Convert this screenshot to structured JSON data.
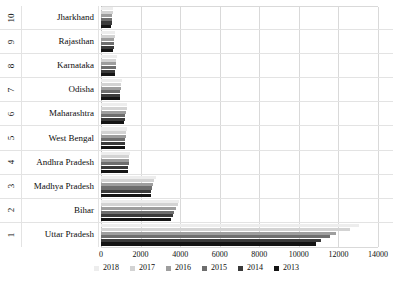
{
  "chart_data": {
    "type": "bar",
    "orientation": "horizontal",
    "title": "",
    "xlabel": "",
    "ylabel": "",
    "xlim": [
      0,
      14000
    ],
    "xticks": [
      "0",
      "2000",
      "4000",
      "6000",
      "8000",
      "10000",
      "12000",
      "14000"
    ],
    "grid": true,
    "legend_position": "bottom",
    "ranks": [
      "10",
      "9",
      "8",
      "7",
      "6",
      "5",
      "4",
      "3",
      "2",
      "1"
    ],
    "categories": [
      "Jharkhand",
      "Rajasthan",
      "Karnataka",
      "Odisha",
      "Maharashtra",
      "West Bengal",
      "Andhra Pradesh",
      "Madhya Pradesh",
      "Bihar",
      "Uttar Pradesh"
    ],
    "series": [
      {
        "name": "2018",
        "color": "#ededed",
        "values": [
          620,
          730,
          800,
          1070,
          1330,
          1310,
          1480,
          2780,
          3960,
          13030
        ]
      },
      {
        "name": "2017",
        "color": "#d3d3d3",
        "values": [
          600,
          700,
          780,
          1030,
          1290,
          1270,
          1440,
          2700,
          3880,
          12560
        ]
      },
      {
        "name": "2016",
        "color": "#9e9e9e",
        "values": [
          580,
          680,
          760,
          1000,
          1250,
          1250,
          1420,
          2640,
          3790,
          11900
        ]
      },
      {
        "name": "2015",
        "color": "#6e6e6e",
        "values": [
          560,
          660,
          740,
          980,
          1220,
          1230,
          1400,
          2590,
          3700,
          11580
        ]
      },
      {
        "name": "2014",
        "color": "#3a3a3a",
        "values": [
          545,
          640,
          720,
          960,
          1200,
          1210,
          1380,
          2550,
          3620,
          11130
        ]
      },
      {
        "name": "2013",
        "color": "#141414",
        "values": [
          530,
          625,
          705,
          940,
          1180,
          1190,
          1360,
          2510,
          3560,
          10870
        ]
      }
    ]
  }
}
